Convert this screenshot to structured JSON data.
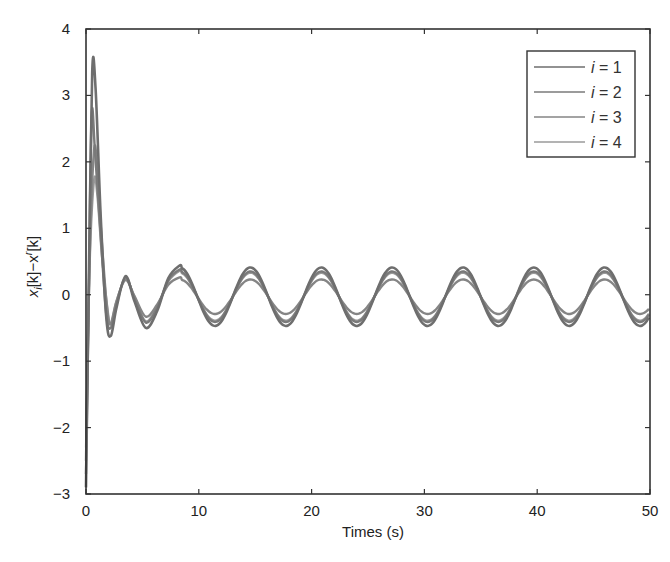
{
  "chart_data": {
    "type": "line",
    "title": "",
    "xlabel": "Times (s)",
    "ylabel": "x_i[k]−x^r[k]",
    "ylabel_parts": {
      "x1": "x",
      "sub": "i",
      "mid": "[k]−x",
      "sup": "r",
      "end": "[k]"
    },
    "xlim": [
      0,
      50
    ],
    "ylim": [
      -3,
      4
    ],
    "xticks": [
      0,
      10,
      20,
      30,
      40,
      50
    ],
    "yticks": [
      -3,
      -2,
      -1,
      0,
      1,
      2,
      3,
      4
    ],
    "xtick_labels": [
      "0",
      "10",
      "20",
      "30",
      "40",
      "50"
    ],
    "ytick_labels": [
      "−3",
      "−2",
      "−1",
      "0",
      "1",
      "2",
      "3",
      "4"
    ],
    "grid": false,
    "legend_position": "upper right",
    "series": [
      {
        "name": "i = 1",
        "color": "#6e6e6e",
        "width": 2.6,
        "transient": [
          [
            0,
            -2.9
          ],
          [
            0.25,
            0.2
          ],
          [
            0.55,
            3.35
          ],
          [
            0.85,
            3.1
          ],
          [
            1.3,
            1.2
          ],
          [
            1.8,
            -0.35
          ],
          [
            2.2,
            -0.62
          ],
          [
            2.7,
            -0.2
          ],
          [
            3.5,
            0.28
          ],
          [
            4.3,
            -0.1
          ],
          [
            5.3,
            -0.5
          ],
          [
            6.3,
            -0.25
          ],
          [
            7.3,
            0.25
          ],
          [
            8.3,
            0.44
          ]
        ],
        "steady_amplitude": 0.44
      },
      {
        "name": "i = 2",
        "color": "#7a7a7a",
        "width": 2.4,
        "transient": [
          [
            0,
            -2.7
          ],
          [
            0.25,
            0.0
          ],
          [
            0.5,
            2.7
          ],
          [
            0.8,
            2.15
          ],
          [
            1.3,
            0.9
          ],
          [
            1.8,
            -0.3
          ],
          [
            2.2,
            -0.5
          ],
          [
            2.7,
            -0.15
          ],
          [
            3.5,
            0.26
          ],
          [
            4.3,
            -0.06
          ],
          [
            5.3,
            -0.42
          ],
          [
            6.3,
            -0.2
          ],
          [
            7.3,
            0.22
          ],
          [
            8.3,
            0.38
          ]
        ],
        "steady_amplitude": 0.38
      },
      {
        "name": "i = 3",
        "color": "#858585",
        "width": 2.4,
        "transient": [
          [
            0,
            -2.5
          ],
          [
            0.3,
            0.4
          ],
          [
            0.7,
            2.15
          ],
          [
            1.0,
            1.9
          ],
          [
            1.4,
            0.8
          ],
          [
            1.9,
            -0.25
          ],
          [
            2.2,
            -0.43
          ],
          [
            2.7,
            -0.1
          ],
          [
            3.5,
            0.22
          ],
          [
            4.3,
            -0.02
          ],
          [
            5.3,
            -0.33
          ],
          [
            6.3,
            -0.15
          ],
          [
            7.3,
            0.15
          ],
          [
            8.3,
            0.26
          ]
        ],
        "steady_amplitude": 0.26
      },
      {
        "name": "i = 4",
        "color": "#9a9a9a",
        "width": 2.2,
        "transient": [
          [
            0,
            -2.3
          ],
          [
            0.3,
            0.3
          ],
          [
            0.7,
            1.7
          ],
          [
            1.0,
            1.5
          ],
          [
            1.4,
            0.6
          ],
          [
            1.9,
            -0.2
          ],
          [
            2.2,
            -0.45
          ],
          [
            2.7,
            -0.1
          ],
          [
            3.5,
            0.24
          ],
          [
            4.3,
            -0.03
          ],
          [
            5.3,
            -0.4
          ],
          [
            6.3,
            -0.18
          ],
          [
            7.3,
            0.2
          ],
          [
            8.3,
            0.36
          ]
        ],
        "steady_amplitude": 0.36
      }
    ],
    "steady_state": {
      "start_t": 8.3,
      "period_s": 6.28,
      "first_peak_t": 8.3,
      "offset": -0.03,
      "peak_times": [
        8.3,
        14.58,
        20.86,
        27.14,
        33.42,
        39.7,
        45.98
      ],
      "trough_times": [
        11.44,
        17.72,
        24.0,
        30.28,
        36.56,
        42.84,
        49.12
      ]
    }
  },
  "legend": {
    "items": [
      {
        "label_var": "i",
        "label_rest": " = 1"
      },
      {
        "label_var": "i",
        "label_rest": " = 2"
      },
      {
        "label_var": "i",
        "label_rest": " = 3"
      },
      {
        "label_var": "i",
        "label_rest": " = 4"
      }
    ]
  },
  "layout": {
    "plot_left": 86,
    "plot_right": 650,
    "plot_top": 29,
    "plot_bottom": 494,
    "legend_box": [
      527,
      51,
      108,
      106
    ]
  }
}
